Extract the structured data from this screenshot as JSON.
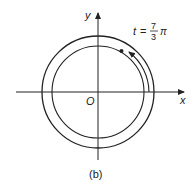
{
  "figure": {
    "caption": "(b)",
    "axes": {
      "x_label": "x",
      "y_label": "y",
      "origin_label": "O"
    },
    "annotation": {
      "var": "t",
      "eq": "=",
      "num": "7",
      "den": "3",
      "pi": "π"
    },
    "circles": [
      {
        "name": "outer",
        "radius": 56
      },
      {
        "name": "inner",
        "radius": 46
      }
    ],
    "colors": {
      "stroke": "#222222",
      "background": "#ffffff"
    }
  }
}
